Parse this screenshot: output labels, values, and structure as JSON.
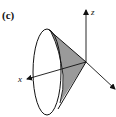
{
  "figure": {
    "panel_label": "(c)",
    "axes": {
      "z_label": "z",
      "x_label": "x",
      "y_label": ""
    },
    "colors": {
      "stroke": "#111111",
      "shade": "#9a9a9a",
      "background": "#ffffff"
    }
  }
}
